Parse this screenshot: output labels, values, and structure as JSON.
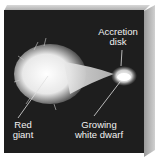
{
  "diagram": {
    "labels": {
      "accretion_disk_line1": "Accretion",
      "accretion_disk_line2": "disk",
      "red_giant_line1": "Red",
      "red_giant_line2": "giant",
      "white_dwarf_line1": "Growing",
      "white_dwarf_line2": "white dwarf"
    },
    "colors": {
      "background": "#1e1e1e",
      "star_glow": "#f4f4f4",
      "label_text": "#f2f2f2",
      "box_side": "#b0b0b0"
    }
  }
}
